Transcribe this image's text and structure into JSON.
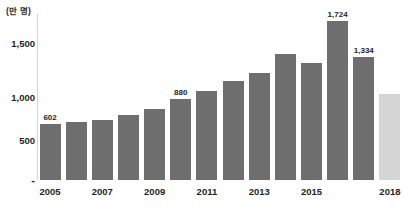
{
  "chart_data": {
    "type": "bar",
    "title": "",
    "unit_label": "(만 명)",
    "xlabel": "",
    "ylabel": "",
    "ylim": [
      0,
      1800
    ],
    "grid": false,
    "legend": "none",
    "ytick_labels": [
      "1,500",
      "1,000",
      "500",
      "-"
    ],
    "ytick_values": [
      1500,
      1000,
      500,
      0
    ],
    "categories": [
      "2005",
      "2006",
      "2007",
      "2008",
      "2009",
      "2010",
      "2011",
      "2012",
      "2013",
      "2014",
      "2015",
      "2016",
      "2017",
      "2018"
    ],
    "visible_xtick_labels": [
      "2005",
      "2007",
      "2009",
      "2011",
      "2013",
      "2015",
      "2018"
    ],
    "values": [
      602,
      625,
      650,
      700,
      765,
      880,
      960,
      1070,
      1160,
      1370,
      1265,
      1724,
      1334,
      930
    ],
    "data_labels": [
      "602",
      "",
      "",
      "",
      "",
      "880",
      "",
      "",
      "",
      "",
      "",
      "1,724",
      "1,334",
      ""
    ],
    "bar_styles": [
      "dark",
      "dark",
      "dark",
      "dark",
      "dark",
      "dark",
      "dark",
      "dark",
      "dark",
      "dark",
      "dark",
      "dark",
      "dark",
      "light"
    ],
    "colors": {
      "bar_dark": "#6e6e6e",
      "bar_light": "#d5d5d5",
      "axis": "#d3d3d3",
      "text": "#231f20",
      "background": "#ffffff"
    }
  }
}
